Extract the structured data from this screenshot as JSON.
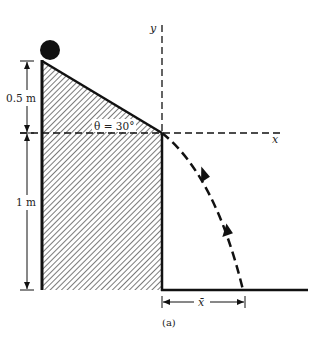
{
  "figure": {
    "caption": "(a)",
    "labels": {
      "height_top": "0.5 m",
      "height_bottom": "1 m",
      "angle": "θ = 30°",
      "x_axis": "x",
      "y_axis": "y",
      "distance": "x̄"
    },
    "elements": {
      "ball": "solid ball at top of incline",
      "incline": "hatched block with 30° slope",
      "trajectory": "dashed parabolic path with two direction arrows",
      "ground": "floor line"
    },
    "colors": {
      "ink": "#111111",
      "hatch": "#333333",
      "background": "#ffffff"
    }
  }
}
